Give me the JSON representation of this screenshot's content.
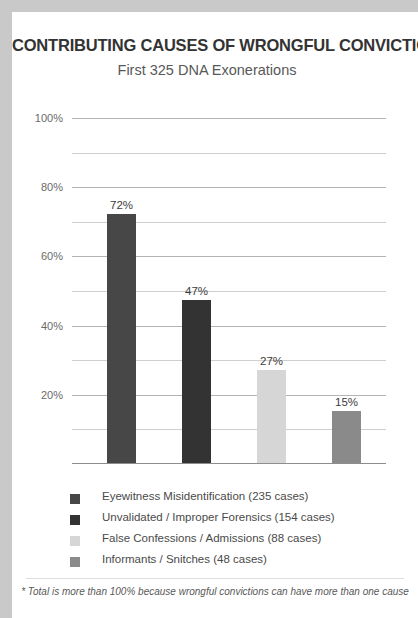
{
  "chart_data": {
    "type": "bar",
    "title": "CONTRIBUTING CAUSES OF WRONGFUL CONVICTIONS",
    "subtitle": "First 325 DNA Exonerations",
    "xlabel": "",
    "ylabel": "",
    "ylim": [
      0,
      100
    ],
    "grid": true,
    "legend_position": "bottom-left",
    "categories": [
      "Eyewitness Misidentification",
      "Unvalidated / Improper Forensics",
      "False Confessions / Admissions",
      "Informants / Snitches"
    ],
    "values": [
      72,
      47,
      27,
      15
    ],
    "value_labels": [
      "72%",
      "47%",
      "27%",
      "15%"
    ],
    "case_counts": [
      235,
      154,
      88,
      48
    ],
    "bar_colors": [
      "#474747",
      "#333333",
      "#d6d6d6",
      "#8a8a8a"
    ],
    "ytick_labels": [
      "100%",
      "80%",
      "60%",
      "40%",
      "20%"
    ],
    "ytick_values": [
      100,
      80,
      60,
      40,
      20
    ],
    "minor_gridline_values": [
      90,
      70,
      50,
      30,
      10
    ],
    "legend_entries": [
      "Eyewitness Misidentification (235 cases)",
      "Unvalidated / Improper Forensics (154 cases)",
      "False Confessions / Admissions (88 cases)",
      "Informants / Snitches (48 cases)"
    ],
    "footnote": "* Total is more than 100% because wrongful convictions can have more than one cause"
  }
}
